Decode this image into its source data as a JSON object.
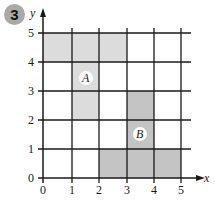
{
  "problem_number": "3",
  "axes": {
    "x_label": "x",
    "y_label": "y",
    "x_ticks": [
      "0",
      "1",
      "2",
      "3",
      "4",
      "5"
    ],
    "y_ticks": [
      "0",
      "1",
      "2",
      "3",
      "4",
      "5"
    ]
  },
  "shapes": [
    {
      "label": "A",
      "fill": "#dcdcdc",
      "vertices": [
        [
          0,
          5
        ],
        [
          3,
          5
        ],
        [
          3,
          4
        ],
        [
          2,
          4
        ],
        [
          2,
          2
        ],
        [
          1,
          2
        ],
        [
          1,
          4
        ],
        [
          0,
          4
        ]
      ]
    },
    {
      "label": "B",
      "fill": "#c4c4c4",
      "vertices": [
        [
          2,
          0
        ],
        [
          5,
          0
        ],
        [
          5,
          1
        ],
        [
          4,
          1
        ],
        [
          4,
          3
        ],
        [
          3,
          3
        ],
        [
          3,
          1
        ],
        [
          2,
          1
        ]
      ]
    }
  ],
  "colors": {
    "grid": "#1a1a1a",
    "badge": "#a9a9a9"
  }
}
